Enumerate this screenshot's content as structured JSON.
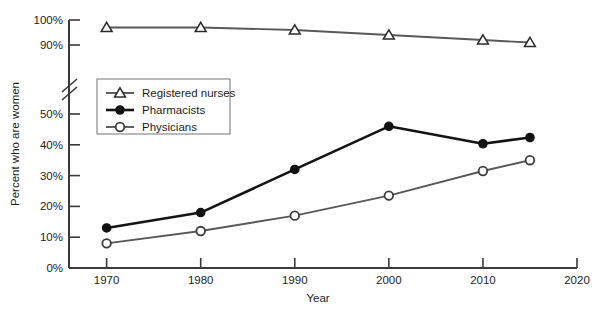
{
  "chart_data": {
    "type": "line",
    "title": "",
    "xlabel": "Year",
    "ylabel": "Percent who are women",
    "x": [
      1970,
      1980,
      1990,
      2000,
      2010,
      2015
    ],
    "xlim": [
      1966,
      2020
    ],
    "xticks": [
      "1970",
      "1980",
      "1990",
      "2000",
      "2010",
      "2020"
    ],
    "xtick_values": [
      1970,
      1980,
      1990,
      2000,
      2010,
      2020
    ],
    "yticks": [
      "0%",
      "10%",
      "20%",
      "30%",
      "40%",
      "50%",
      "90%",
      "100%"
    ],
    "ytick_values": [
      0,
      10,
      20,
      30,
      40,
      50,
      90,
      100
    ],
    "y_axis_break": true,
    "y_axis_break_between": [
      50,
      90
    ],
    "grid": false,
    "legend_position": "upper-left-inside",
    "series": [
      {
        "name": "Registered nurses",
        "marker": "open-triangle",
        "color": "#595959",
        "values": [
          97,
          97,
          96,
          94,
          92,
          91
        ]
      },
      {
        "name": "Pharmacists",
        "marker": "filled-circle",
        "color": "#141414",
        "values": [
          13,
          18,
          32,
          46,
          50.5,
          53
        ]
      },
      {
        "name": "Physicians",
        "marker": "open-circle",
        "color": "#595959",
        "values": [
          8,
          12,
          17,
          23.5,
          31.5,
          35
        ]
      }
    ]
  },
  "legend": {
    "items": [
      {
        "label": "Registered nurses"
      },
      {
        "label": "Pharmacists"
      },
      {
        "label": "Physicians"
      }
    ]
  },
  "axes": {
    "x_title": "Year",
    "y_title": "Percent who are women"
  }
}
